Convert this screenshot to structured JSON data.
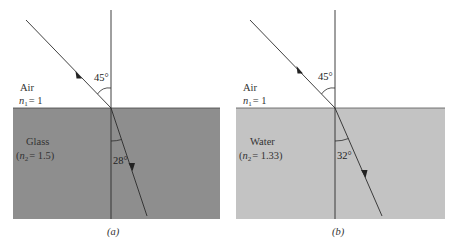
{
  "figure": {
    "panels": [
      {
        "id": "a",
        "caption": "(a)",
        "upper_medium": {
          "name": "Air",
          "index_label_prefix": "n",
          "index_sub": "1",
          "index_value": "= 1"
        },
        "lower_medium": {
          "name": "Glass",
          "index_label_open": "(",
          "index_label_prefix": "n",
          "index_sub": "2",
          "index_value": "= 1.5)",
          "color": "#8e8e8e"
        },
        "incident_angle": "45°",
        "refracted_angle": "28°"
      },
      {
        "id": "b",
        "caption": "(b)",
        "upper_medium": {
          "name": "Air",
          "index_label_prefix": "n",
          "index_sub": "1",
          "index_value": "= 1"
        },
        "lower_medium": {
          "name": "Water",
          "index_label_open": "(",
          "index_label_prefix": "n",
          "index_sub": "2",
          "index_value": "= 1.33)",
          "color": "#c3c3c3"
        },
        "incident_angle": "45°",
        "refracted_angle": "32°"
      }
    ],
    "line_color": "#2b2b2b"
  }
}
